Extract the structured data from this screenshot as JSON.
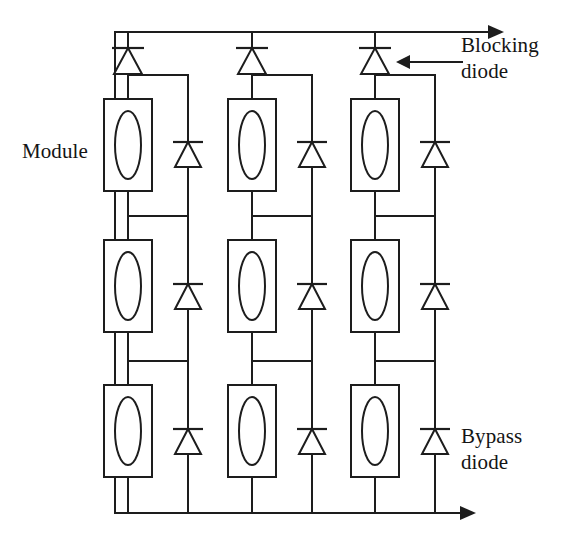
{
  "diagram": {
    "type": "electrical-schematic",
    "canvas": {
      "width": 566,
      "height": 543,
      "background": "#ffffff"
    },
    "stroke_color": "#1d1d1d",
    "labels": {
      "module": "Module",
      "blocking_diode_line1": "Blocking",
      "blocking_diode_line2": "diode",
      "bypass_diode_line1": "Bypass",
      "bypass_diode_line2": "diode"
    },
    "counts": {
      "strings": 3,
      "modules_per_string": 3,
      "modules_total": 9,
      "blocking_diodes": 3,
      "bypass_diodes": 9
    },
    "icons": {
      "diode": "diode-symbol",
      "module": "pv-module-symbol",
      "current_arrow": "arrow-right-icon",
      "callout_arrow": "arrow-left-icon"
    },
    "geometry": {
      "top_rail_y": 32,
      "bottom_rail_y": 513,
      "top_rail_x_start": 115,
      "top_rail_arrow_x": 500,
      "bottom_rail_x_start": 115,
      "bottom_rail_arrow_x": 472,
      "string_module_x": [
        128,
        252,
        375
      ],
      "string_bypass_x": [
        188,
        312,
        435
      ],
      "module_box_width": 48,
      "module_box_height": 92,
      "module_row_tops": [
        99,
        240,
        385
      ],
      "blocking_diode_y": 60,
      "bypass_diode_rows_y": [
        153,
        295,
        440
      ],
      "branch_top_y": [
        75,
        216,
        361
      ],
      "branch_bottom_y": [
        216,
        361,
        513
      ],
      "callout_blocking_arrow_y": 62,
      "callout_blocking_x_from": 462,
      "callout_blocking_x_to": 402
    }
  }
}
